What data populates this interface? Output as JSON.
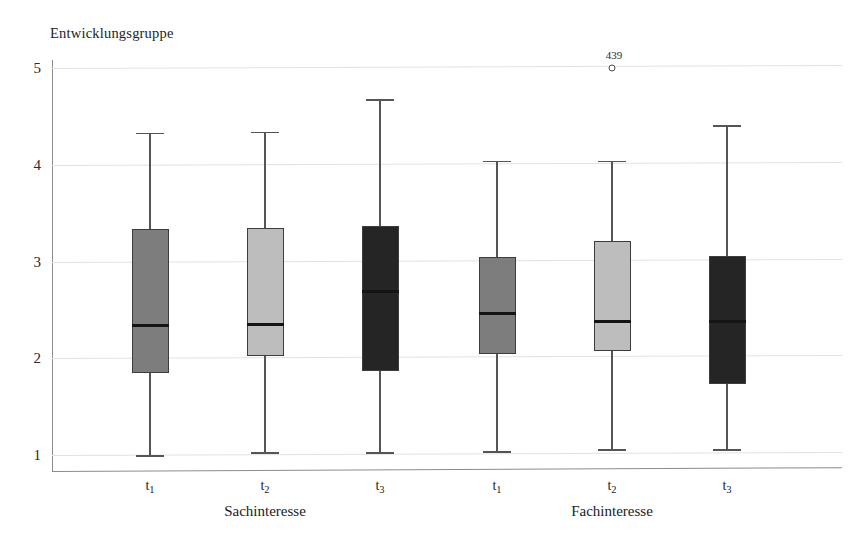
{
  "chart_data": {
    "type": "box",
    "title": "Entwicklungsgruppe",
    "xlabel": "",
    "ylabel": "",
    "ylim": [
      1,
      5
    ],
    "yticks": [
      1,
      2,
      3,
      4,
      5
    ],
    "ytick_labels": [
      "1",
      "2",
      "3",
      "4",
      "5"
    ],
    "grid": true,
    "legend": "none",
    "groups": [
      {
        "name": "Sachinteresse",
        "categories": [
          "t1",
          "t2",
          "t3"
        ]
      },
      {
        "name": "Fachinteresse",
        "categories": [
          "t1",
          "t2",
          "t3"
        ]
      }
    ],
    "boxes": [
      {
        "group": "Sachinteresse",
        "category": "t1",
        "label": "t",
        "sub": "1",
        "color": "#7d7d7d",
        "whisker_low": 1.0,
        "q1": 1.85,
        "median": 2.34,
        "q3": 3.34,
        "whisker_high": 4.33,
        "outliers": []
      },
      {
        "group": "Sachinteresse",
        "category": "t2",
        "label": "t",
        "sub": "2",
        "color": "#bdbdbd",
        "whisker_low": 1.03,
        "q1": 2.02,
        "median": 2.35,
        "q3": 3.35,
        "whisker_high": 4.34,
        "outliers": []
      },
      {
        "group": "Sachinteresse",
        "category": "t3",
        "label": "t",
        "sub": "3",
        "color": "#252525",
        "whisker_low": 1.03,
        "q1": 1.87,
        "median": 2.69,
        "q3": 3.37,
        "whisker_high": 4.68,
        "outliers": []
      },
      {
        "group": "Fachinteresse",
        "category": "t1",
        "label": "t",
        "sub": "1",
        "color": "#7d7d7d",
        "whisker_low": 1.04,
        "q1": 2.04,
        "median": 2.46,
        "q3": 3.05,
        "whisker_high": 4.04,
        "outliers": []
      },
      {
        "group": "Fachinteresse",
        "category": "t2",
        "label": "t",
        "sub": "2",
        "color": "#bdbdbd",
        "whisker_low": 1.06,
        "q1": 2.07,
        "median": 2.38,
        "q3": 3.21,
        "whisker_high": 4.04,
        "outliers": [
          {
            "value": 5.0,
            "label": "439"
          }
        ]
      },
      {
        "group": "Fachinteresse",
        "category": "t3",
        "label": "t",
        "sub": "3",
        "color": "#252525",
        "whisker_low": 1.06,
        "q1": 1.73,
        "median": 2.38,
        "q3": 3.06,
        "whisker_high": 4.41,
        "outliers": []
      }
    ]
  }
}
